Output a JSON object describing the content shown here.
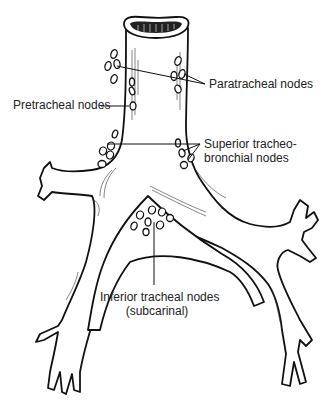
{
  "figure": {
    "line_color": "#111111",
    "label_color": "#222222",
    "background": "#ffffff"
  },
  "labels": {
    "paratracheal": "Paratracheal nodes",
    "pretracheal": "Pretracheal nodes",
    "superior_line1": "Superior tracheo-",
    "superior_line2": "bronchial nodes",
    "inferior_line1": "Inferior tracheal nodes",
    "inferior_line2": "(subcarinal)"
  }
}
